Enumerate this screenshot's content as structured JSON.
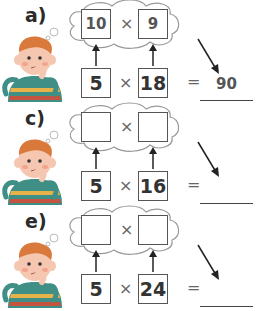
{
  "problems": [
    {
      "label": "a)",
      "thought_left": "10",
      "thought_right": "9",
      "factor_left": "5",
      "factor_right": "18",
      "times": "×",
      "equals": "=",
      "answer": "90"
    },
    {
      "label": "c)",
      "thought_left": "",
      "thought_right": "",
      "factor_left": "5",
      "factor_right": "16",
      "times": "×",
      "equals": "=",
      "answer": ""
    },
    {
      "label": "e)",
      "thought_left": "",
      "thought_right": "",
      "factor_left": "5",
      "factor_right": "24",
      "times": "×",
      "equals": "=",
      "answer": ""
    }
  ],
  "colors": {
    "hair": "#d9793b",
    "skin": "#f6c7b0",
    "cheek": "#f2a48e",
    "shirt_teal": "#3f8f86",
    "shirt_stripe": "#e8b24a",
    "shirt_red": "#c4533f",
    "outline": "#555555"
  }
}
